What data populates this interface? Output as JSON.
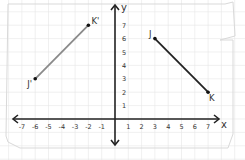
{
  "diagram": {
    "type": "coordinate-plane-reflection",
    "axes": {
      "x_label": "x",
      "y_label": "y",
      "x_ticks": [
        "-7",
        "-6",
        "-5",
        "-4",
        "-3",
        "-2",
        "-1",
        "1",
        "2",
        "3",
        "4",
        "5",
        "6",
        "7"
      ],
      "y_ticks": [
        "1",
        "2",
        "3",
        "4",
        "5",
        "6",
        "7"
      ],
      "x_range": [
        -7,
        7
      ],
      "y_range": [
        -1,
        8
      ]
    },
    "segments": [
      {
        "name": "JK",
        "color": "#222222",
        "points": [
          {
            "label": "J",
            "x": 3,
            "y": 6
          },
          {
            "label": "K",
            "x": 7,
            "y": 2
          }
        ]
      },
      {
        "name": "J'K'",
        "color": "#8a8a8a",
        "points": [
          {
            "label": "J'",
            "x": -6,
            "y": 3
          },
          {
            "label": "K'",
            "x": -2,
            "y": 7
          }
        ]
      }
    ],
    "background": "graph-paper",
    "colors": {
      "grid": "#e6e6e6",
      "axis": "#222222",
      "paper_edge": "#cfcfcf"
    }
  }
}
